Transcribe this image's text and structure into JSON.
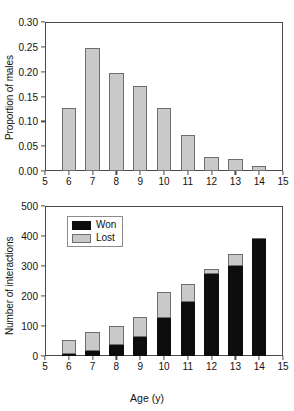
{
  "chart_data": [
    {
      "type": "bar",
      "panel": "top",
      "title": "",
      "xlabel": "",
      "ylabel": "Proportion of males",
      "categories": [
        "6",
        "7",
        "8",
        "9",
        "10",
        "11",
        "12",
        "13",
        "14"
      ],
      "values": [
        0.126,
        0.248,
        0.198,
        0.172,
        0.126,
        0.072,
        0.028,
        0.025,
        0.01
      ],
      "xlim": [
        5,
        15
      ],
      "ylim": [
        0.0,
        0.3
      ],
      "xticks": [
        "5",
        "6",
        "7",
        "8",
        "9",
        "10",
        "11",
        "12",
        "13",
        "14",
        "15"
      ],
      "yticks": [
        "0.00",
        "0.05",
        "0.10",
        "0.15",
        "0.20",
        "0.25",
        "0.30"
      ],
      "grid": false,
      "legend": null,
      "bar_color": "#c9c9c9",
      "bar_edge_color": "#6e6e6e"
    },
    {
      "type": "bar",
      "panel": "bottom",
      "stacked": true,
      "title": "",
      "xlabel": "Age (y)",
      "ylabel": "Number of interactions",
      "categories": [
        "6",
        "7",
        "8",
        "9",
        "10",
        "11",
        "12",
        "13",
        "14"
      ],
      "series": [
        {
          "name": "Won",
          "values": [
            6,
            17,
            35,
            62,
            127,
            181,
            274,
            301,
            391
          ],
          "color": "#0d0d0d"
        },
        {
          "name": "Lost",
          "values": [
            47,
            64,
            66,
            68,
            85,
            58,
            17,
            39,
            3
          ],
          "color": "#c9c9c9"
        }
      ],
      "totals": [
        53,
        81,
        101,
        130,
        212,
        239,
        291,
        340,
        394
      ],
      "xlim": [
        5,
        15
      ],
      "ylim": [
        0,
        500
      ],
      "xticks": [
        "5",
        "6",
        "7",
        "8",
        "9",
        "10",
        "11",
        "12",
        "13",
        "14",
        "15"
      ],
      "yticks": [
        "0",
        "100",
        "200",
        "300",
        "400",
        "500"
      ],
      "grid": false,
      "legend": {
        "position": "top-left",
        "entries": [
          "Won",
          "Lost"
        ]
      }
    }
  ]
}
